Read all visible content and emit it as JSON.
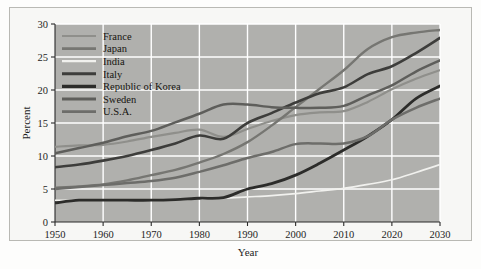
{
  "figure": {
    "background_color": "#fdfdfc",
    "frame_color": "#b9b9b4",
    "plot_background_color": "#b0b0ad",
    "gridline_color": "#ffffff",
    "axis_color": "#2a2a2a"
  },
  "chart_data": {
    "type": "line",
    "title": "",
    "subtitle": "",
    "xlabel": "Year",
    "ylabel": "Percent",
    "xlim": [
      1950,
      2030
    ],
    "ylim": [
      0,
      30
    ],
    "xticks": [
      1950,
      1960,
      1970,
      1980,
      1990,
      2000,
      2010,
      2020,
      2030
    ],
    "xtick_labels": [
      "1950",
      "1960",
      "1970",
      "1980",
      "1990",
      "2000",
      "2010",
      "2020",
      "2030"
    ],
    "yticks": [
      0,
      5,
      10,
      15,
      20,
      25,
      30
    ],
    "ytick_labels": [
      "0",
      "5",
      "10",
      "15",
      "20",
      "25",
      "30"
    ],
    "grid": true,
    "grid_axis": "both",
    "legend_position": "upper-left-inside",
    "x": [
      1950,
      1955,
      1960,
      1965,
      1970,
      1975,
      1980,
      1985,
      1990,
      1995,
      2000,
      2005,
      2010,
      2015,
      2020,
      2025,
      2030
    ],
    "series": [
      {
        "name": "France",
        "color": "#8f8f8b",
        "line_width": 2.2,
        "values": [
          11.4,
          11.6,
          11.7,
          12.2,
          12.9,
          13.5,
          14.0,
          12.9,
          14.1,
          15.3,
          16.2,
          16.6,
          16.8,
          18.2,
          20.1,
          21.7,
          23.0
        ]
      },
      {
        "name": "Japan",
        "color": "#767672",
        "line_width": 2.4,
        "values": [
          5.2,
          5.4,
          5.7,
          6.3,
          7.1,
          7.9,
          9.0,
          10.3,
          12.1,
          14.6,
          17.4,
          20.2,
          23.0,
          26.2,
          28.0,
          28.7,
          29.1
        ]
      },
      {
        "name": "India",
        "color": "#f1f1ee",
        "line_width": 1.6,
        "values": [
          3.3,
          3.3,
          3.3,
          3.3,
          3.3,
          3.4,
          3.5,
          3.6,
          3.8,
          4.0,
          4.3,
          4.7,
          5.1,
          5.7,
          6.4,
          7.5,
          8.7
        ]
      },
      {
        "name": "Italy",
        "color": "#3d3d3b",
        "line_width": 2.6,
        "values": [
          8.3,
          8.7,
          9.3,
          10.0,
          10.9,
          11.9,
          13.1,
          12.6,
          15.0,
          16.5,
          18.1,
          19.5,
          20.4,
          22.4,
          23.6,
          25.6,
          27.9
        ]
      },
      {
        "name": "Republic of Korea",
        "color": "#2c2c2a",
        "line_width": 2.8,
        "values": [
          2.9,
          3.3,
          3.3,
          3.3,
          3.3,
          3.4,
          3.6,
          3.7,
          5.0,
          5.8,
          7.1,
          8.9,
          10.9,
          13.0,
          15.5,
          18.7,
          20.6
        ]
      },
      {
        "name": "Sweden",
        "color": "#5e5e5b",
        "line_width": 2.5,
        "values": [
          10.4,
          11.2,
          12.0,
          13.0,
          13.8,
          15.1,
          16.4,
          17.8,
          17.8,
          17.4,
          17.3,
          17.3,
          17.6,
          19.2,
          20.7,
          22.8,
          24.5
        ]
      },
      {
        "name": "U.S.A.",
        "color": "#6d6d6a",
        "line_width": 2.5,
        "values": [
          5.0,
          5.3,
          5.6,
          5.9,
          6.2,
          6.7,
          7.6,
          8.6,
          9.7,
          10.6,
          11.8,
          11.9,
          11.9,
          13.0,
          15.5,
          17.3,
          18.7
        ]
      }
    ]
  },
  "legend": {
    "entries": [
      {
        "label": "France",
        "color": "#8f8f8b",
        "line_width": 2.2
      },
      {
        "label": "Japan",
        "color": "#767672",
        "line_width": 2.8
      },
      {
        "label": "India",
        "color": "#f1f1ee",
        "line_width": 2.2
      },
      {
        "label": "Italy",
        "color": "#3d3d3b",
        "line_width": 3.0
      },
      {
        "label": "Republic of Korea",
        "color": "#2c2c2a",
        "line_width": 3.2
      },
      {
        "label": "Sweden",
        "color": "#5e5e5b",
        "line_width": 2.8
      },
      {
        "label": "U.S.A.",
        "color": "#6d6d6a",
        "line_width": 2.8
      }
    ]
  }
}
